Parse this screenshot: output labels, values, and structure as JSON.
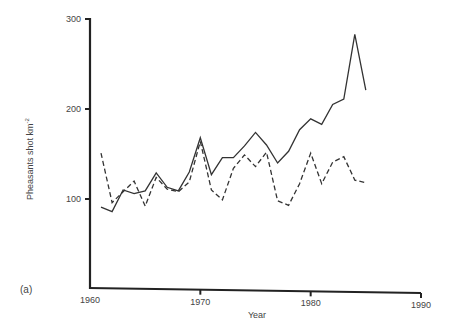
{
  "chart_data": {
    "type": "line",
    "title": "",
    "panel_label": "(a)",
    "xlabel": "Year",
    "ylabel": "Pheasants shot km",
    "ylabel_superscript": "-2",
    "xlim": [
      1960,
      1990
    ],
    "ylim": [
      0,
      300
    ],
    "x_ticks": [
      1960,
      1970,
      1980,
      1990
    ],
    "y_ticks": [
      100,
      200,
      300
    ],
    "grid": false,
    "legend": null,
    "x": [
      1961,
      1962,
      1963,
      1964,
      1965,
      1966,
      1967,
      1968,
      1969,
      1970,
      1971,
      1972,
      1973,
      1974,
      1975,
      1976,
      1977,
      1978,
      1979,
      1980,
      1981,
      1982,
      1983,
      1984,
      1985
    ],
    "series": [
      {
        "name": "solid",
        "style": "solid",
        "values": [
          91,
          86,
          110,
          106,
          109,
          129,
          113,
          109,
          130,
          168,
          127,
          146,
          146,
          159,
          174,
          160,
          140,
          153,
          177,
          189,
          183,
          205,
          211,
          283,
          221
        ]
      },
      {
        "name": "dashed",
        "style": "dashed",
        "values": [
          151,
          96,
          108,
          120,
          92,
          124,
          111,
          108,
          119,
          164,
          110,
          99,
          134,
          149,
          136,
          152,
          98,
          93,
          117,
          151,
          117,
          141,
          147,
          121,
          118
        ]
      }
    ]
  }
}
